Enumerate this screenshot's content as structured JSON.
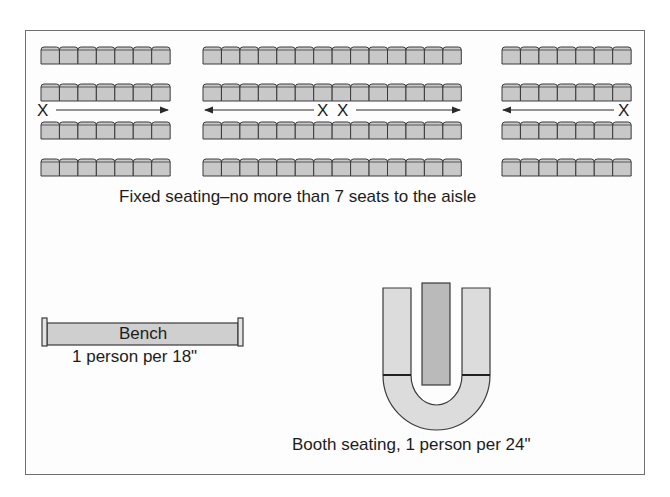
{
  "diagram": {
    "fixed_seating": {
      "caption": "Fixed seating–no more than 7 seats to the aisle",
      "blocks": [
        {
          "name": "left",
          "seats_per_row": 7,
          "rows": 4,
          "x": 41
        },
        {
          "name": "center",
          "seats_per_row": 14,
          "rows": 4,
          "x": 203
        },
        {
          "name": "right",
          "seats_per_row": 7,
          "rows": 4,
          "x": 502
        }
      ],
      "row_y": [
        46,
        83,
        121,
        158
      ],
      "seat_width": 18.45,
      "aisle_markers": [
        {
          "label": "X",
          "position": "left",
          "arrow": "right"
        },
        {
          "label": "X",
          "position": "center-left",
          "arrow": "left"
        },
        {
          "label": "X",
          "position": "center-right",
          "arrow": "right"
        },
        {
          "label": "X",
          "position": "right",
          "arrow": "left"
        }
      ]
    },
    "bench": {
      "label": "Bench",
      "caption": "1 person per 18\""
    },
    "booth": {
      "caption": "Booth seating, 1 person per 24\""
    },
    "colors": {
      "seat_fill": "#c8c8c8",
      "seat_stroke": "#3a3a3a",
      "bench_fill": "#cfcfcf",
      "booth_fill": "#d9d9d9",
      "table_fill": "#b8b8b8",
      "frame": "#6f6f6f"
    }
  }
}
